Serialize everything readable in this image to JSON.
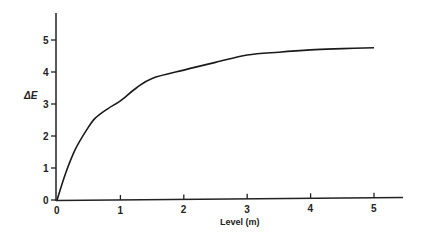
{
  "chart_data": {
    "type": "line",
    "title": "",
    "xlabel": "Level (m)",
    "ylabel": "ΔE",
    "xlim": [
      0,
      5.5
    ],
    "ylim": [
      0,
      5.8
    ],
    "grid": false,
    "legend": null,
    "x_ticks": [
      "0",
      "1",
      "2",
      "3",
      "4",
      "5"
    ],
    "y_ticks": [
      "0",
      "1",
      "2",
      "3",
      "4",
      "5"
    ],
    "series": [
      {
        "name": "ΔE",
        "x": [
          0,
          0.13,
          0.28,
          0.47,
          0.6,
          0.8,
          1.0,
          1.25,
          1.5,
          2.0,
          2.5,
          3.0,
          3.5,
          4.0,
          4.5,
          5.0
        ],
        "values": [
          0,
          0.8,
          1.55,
          2.2,
          2.55,
          2.85,
          3.1,
          3.5,
          3.8,
          4.06,
          4.3,
          4.53,
          4.62,
          4.69,
          4.73,
          4.76
        ]
      }
    ]
  },
  "colors": {
    "line": "#1a1a1a",
    "axis": "#222222",
    "background": "#ffffff"
  }
}
